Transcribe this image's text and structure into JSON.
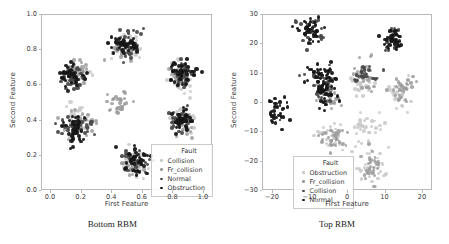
{
  "figure": {
    "panels": [
      {
        "id": "bottom-rbm",
        "caption": "Bottom RBM",
        "xlabel": "First Feature",
        "ylabel": "Second Feature",
        "xticks": [
          "0.0",
          "0.2",
          "0.4",
          "0.6",
          "0.8",
          "1.0"
        ],
        "yticks": [
          "1.0",
          "0.8",
          "0.6",
          "0.4",
          "0.2",
          "0.0"
        ],
        "legend": {
          "title": "Fault",
          "entries": [
            {
              "label": "Collision",
              "color": "#c8c8c8"
            },
            {
              "label": "Fr_collision",
              "color": "#9a9a9a"
            },
            {
              "label": "Normal",
              "color": "#4a4a4a"
            },
            {
              "label": "Obstruction",
              "color": "#161616"
            }
          ]
        }
      },
      {
        "id": "top-rbm",
        "caption": "Top RBM",
        "xlabel": "First Feature",
        "ylabel": "Second Feature",
        "xticks": [
          "-20",
          "-10",
          "0",
          "10",
          "20"
        ],
        "yticks": [
          "30",
          "20",
          "10",
          "0",
          "-10",
          "-20",
          "-30"
        ],
        "legend": {
          "title": "Fault",
          "entries": [
            {
              "label": "Obstruction",
              "color": "#c8c8c8"
            },
            {
              "label": "Fr_collision",
              "color": "#9a9a9a"
            },
            {
              "label": "Collision",
              "color": "#4a4a4a"
            },
            {
              "label": "Normal",
              "color": "#161616"
            }
          ]
        }
      }
    ]
  },
  "chart_data": [
    {
      "type": "scatter",
      "title": "Bottom RBM",
      "xlabel": "First Feature",
      "ylabel": "Second Feature",
      "xlim": [
        -0.05,
        1.05
      ],
      "ylim": [
        -0.05,
        1.05
      ],
      "xticks": [
        0.0,
        0.2,
        0.4,
        0.6,
        0.8,
        1.0
      ],
      "yticks": [
        0.0,
        0.2,
        0.4,
        0.6,
        0.8,
        1.0
      ],
      "grid": false,
      "legend_position": "lower right",
      "legend_title": "Fault",
      "series": [
        {
          "name": "Collision",
          "color": "#c8c8c8",
          "cluster_centers": [
            [
              0.16,
              0.68
            ],
            [
              0.5,
              0.85
            ],
            [
              0.85,
              0.67
            ],
            [
              0.55,
              0.12
            ],
            [
              0.18,
              0.37
            ],
            [
              0.86,
              0.37
            ]
          ],
          "n_points": 170
        },
        {
          "name": "Fr_collision",
          "color": "#9a9a9a",
          "cluster_centers": [
            [
              0.18,
              0.7
            ],
            [
              0.48,
              0.83
            ],
            [
              0.84,
              0.66
            ],
            [
              0.53,
              0.1
            ],
            [
              0.2,
              0.36
            ],
            [
              0.88,
              0.36
            ],
            [
              0.45,
              0.5
            ]
          ],
          "n_points": 180
        },
        {
          "name": "Normal",
          "color": "#4a4a4a",
          "cluster_centers": [
            [
              0.15,
              0.66
            ],
            [
              0.52,
              0.87
            ],
            [
              0.86,
              0.68
            ],
            [
              0.56,
              0.14
            ],
            [
              0.17,
              0.35
            ],
            [
              0.85,
              0.39
            ]
          ],
          "n_points": 190
        },
        {
          "name": "Obstruction",
          "color": "#161616",
          "cluster_centers": [
            [
              0.14,
              0.67
            ],
            [
              0.51,
              0.86
            ],
            [
              0.87,
              0.69
            ],
            [
              0.57,
              0.13
            ],
            [
              0.16,
              0.34
            ],
            [
              0.87,
              0.38
            ]
          ],
          "n_points": 230
        }
      ]
    },
    {
      "type": "scatter",
      "title": "Top RBM",
      "xlabel": "First Feature",
      "ylabel": "Second Feature",
      "xlim": [
        -29,
        25
      ],
      "ylim": [
        -37,
        33
      ],
      "xticks": [
        -20,
        -10,
        0,
        10,
        20
      ],
      "yticks": [
        -30,
        -20,
        -10,
        0,
        10,
        20,
        30
      ],
      "grid": false,
      "legend_position": "lower left",
      "legend_title": "Fault",
      "series": [
        {
          "name": "Obstruction",
          "color": "#c8c8c8",
          "cluster_centers": [
            [
              -7,
              -16
            ],
            [
              5,
              -13
            ],
            [
              6,
              -29
            ],
            [
              15,
              2
            ],
            [
              3,
              6
            ]
          ],
          "n_points": 160
        },
        {
          "name": "Fr_collision",
          "color": "#9a9a9a",
          "cluster_centers": [
            [
              -8,
              -1
            ],
            [
              4,
              8
            ],
            [
              16,
              3
            ],
            [
              6,
              -28
            ],
            [
              -6,
              -16
            ]
          ],
          "n_points": 150
        },
        {
          "name": "Collision",
          "color": "#4a4a4a",
          "cluster_centers": [
            [
              -14,
              26
            ],
            [
              -11,
              8
            ],
            [
              -9,
              2
            ],
            [
              13,
              23
            ],
            [
              4,
              9
            ]
          ],
          "n_points": 130
        },
        {
          "name": "Normal",
          "color": "#161616",
          "cluster_centers": [
            [
              -25,
              -6
            ],
            [
              -14,
              27
            ],
            [
              13,
              23
            ],
            [
              -10,
              9
            ],
            [
              -9,
              3
            ]
          ],
          "n_points": 190
        }
      ]
    }
  ]
}
